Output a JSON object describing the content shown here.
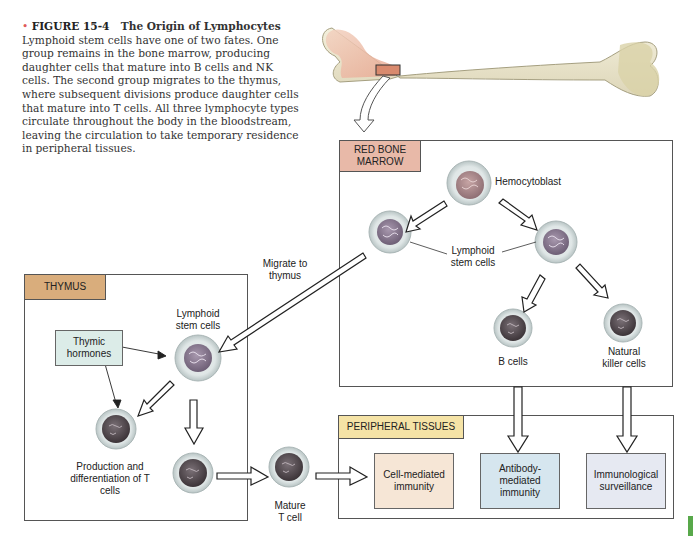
{
  "caption": {
    "bullet": "•",
    "figure_label": "FIGURE 15-4",
    "figure_title": "The Origin of Lymphocytes",
    "body": "Lymphoid stem cells have one of two fates. One group remains in the bone marrow, producing daughter cells that mature into B cells and NK cells. The second group migrates to the thymus, where subsequent divisions produce daughter cells that mature into T cells. All three lymphocyte types circulate throughout the body in the bloodstream, leaving the circulation to take temporary residence in peripheral tissues."
  },
  "regions": {
    "red_bone_marrow": {
      "title": "RED BONE MARROW",
      "color": "#e8b9a8"
    },
    "thymus": {
      "title": "THYMUS",
      "color": "#d9ad7c"
    },
    "peripheral_tissues": {
      "title": "PERIPHERAL TISSUES",
      "color": "#f5e3a6"
    }
  },
  "labels": {
    "hemocytoblast": "Hemocytoblast",
    "lymphoid_stem_cells_marrow": "Lymphoid stem cells",
    "b_cells": "B cells",
    "nk_cells": "Natural killer cells",
    "migrate_to_thymus": "Migrate to thymus",
    "lymphoid_stem_cells_thymus": "Lymphoid stem cells",
    "thymic_hormones": "Thymic hormones",
    "production_differentiation": "Production and differentiation of T cells",
    "mature_t_cell": "Mature T cell"
  },
  "outcomes": [
    {
      "label": "Cell-mediated immunity",
      "color": "#f6e6d6"
    },
    {
      "label": "Antibody-mediated immunity",
      "color": "#d6e6ef"
    },
    {
      "label": "Immunological surveillance",
      "color": "#e6e9f2"
    }
  ],
  "colors": {
    "thymic_hormones_box": "#dcece8",
    "accent_green": "#58a84a"
  }
}
